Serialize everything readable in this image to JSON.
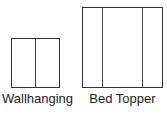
{
  "diagram": {
    "items": [
      {
        "label": "Wallhanging",
        "panels": 2
      },
      {
        "label": "Bed Topper",
        "panels": 3
      }
    ]
  }
}
